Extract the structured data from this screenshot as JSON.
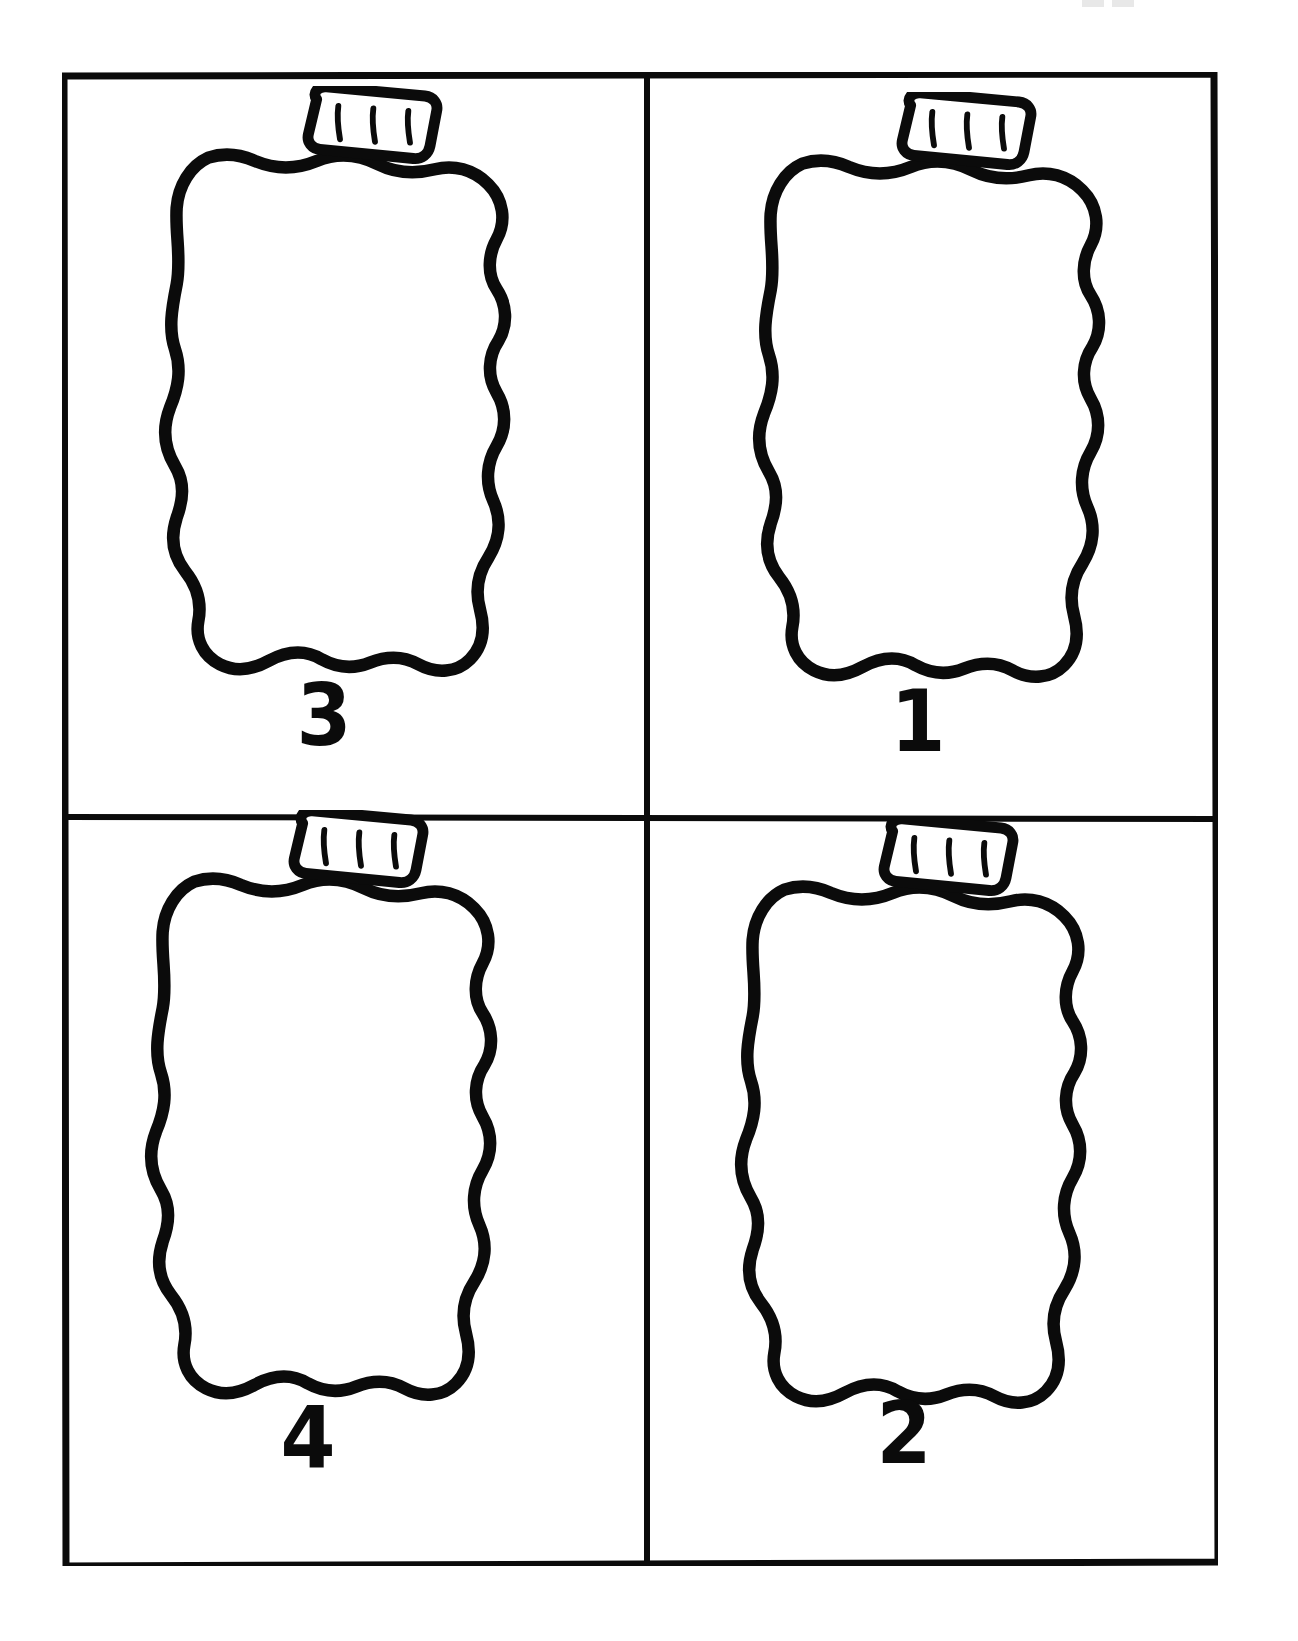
{
  "page": {
    "background_color": "#ffffff",
    "ink_color": "#0b0b0b",
    "orientation": "portrait",
    "grid": {
      "rows": 2,
      "columns": 4
    }
  },
  "frame": {
    "name": "outer-border",
    "stroke_color": "#0b0b0b",
    "divider_horizontal": true,
    "divider_vertical": true
  },
  "cells": [
    {
      "position": "top-left",
      "label": "3",
      "shape": "bell-pepper-outline",
      "stem": {
        "shape": "rounded-quadrilateral",
        "tick_marks": 3,
        "tilt": "left"
      }
    },
    {
      "position": "top-right",
      "label": "1",
      "shape": "bell-pepper-outline",
      "stem": {
        "shape": "rounded-quadrilateral",
        "tick_marks": 3,
        "tilt": "left"
      }
    },
    {
      "position": "bottom-left",
      "label": "4",
      "shape": "bell-pepper-outline",
      "stem": {
        "shape": "rounded-quadrilateral",
        "tick_marks": 3,
        "tilt": "left"
      }
    },
    {
      "position": "bottom-right",
      "label": "2",
      "shape": "bell-pepper-outline",
      "stem": {
        "shape": "rounded-quadrilateral",
        "tick_marks": 3,
        "tilt": "left"
      }
    }
  ]
}
